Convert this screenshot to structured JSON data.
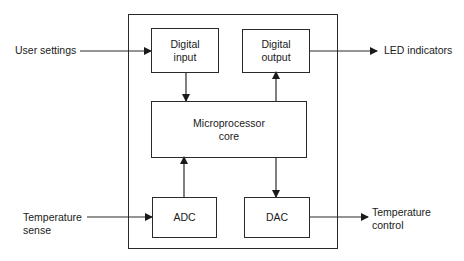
{
  "diagram": {
    "type": "block-diagram",
    "blocks": {
      "digital_input": "Digital\ninput",
      "digital_output": "Digital\noutput",
      "core": "Microprocessor\ncore",
      "adc": "ADC",
      "dac": "DAC"
    },
    "external": {
      "user_settings": "User settings",
      "led_indicators": "LED indicators",
      "temperature_sense": "Temperature\nsense",
      "temperature_control": "Temperature\ncontrol"
    },
    "connections": [
      {
        "from": "user_settings",
        "to": "digital_input"
      },
      {
        "from": "digital_input",
        "to": "core"
      },
      {
        "from": "core",
        "to": "digital_output"
      },
      {
        "from": "digital_output",
        "to": "led_indicators"
      },
      {
        "from": "temperature_sense",
        "to": "adc"
      },
      {
        "from": "adc",
        "to": "core"
      },
      {
        "from": "core",
        "to": "dac"
      },
      {
        "from": "dac",
        "to": "temperature_control"
      }
    ],
    "colors": {
      "stroke": "#2a2a2a",
      "background": "#ffffff"
    }
  }
}
